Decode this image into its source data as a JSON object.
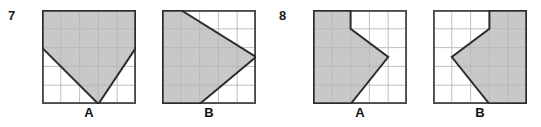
{
  "page": {
    "background_color": "#ffffff",
    "shade_color": "#c8c8c8",
    "grid_line_color": "#b6b6b6",
    "outline_color": "#4a4a4a",
    "shape_line_color": "#2b2b2b"
  },
  "problems": [
    {
      "number": "7",
      "figures": [
        {
          "label": "A",
          "grid": {
            "cols": 5,
            "rows": 5
          },
          "shaded_polygon": [
            [
              0,
              0
            ],
            [
              5,
              0
            ],
            [
              5,
              2
            ],
            [
              3,
              5
            ],
            [
              0,
              2
            ]
          ]
        },
        {
          "label": "B",
          "grid": {
            "cols": 5,
            "rows": 5
          },
          "shaded_polygon": [
            [
              0,
              0
            ],
            [
              1,
              0
            ],
            [
              5,
              2.5
            ],
            [
              2,
              5
            ],
            [
              0,
              5
            ]
          ]
        }
      ]
    },
    {
      "number": "8",
      "figures": [
        {
          "label": "A",
          "grid": {
            "cols": 5,
            "rows": 5
          },
          "shaded_polygon": [
            [
              0,
              0
            ],
            [
              2,
              0
            ],
            [
              2,
              1
            ],
            [
              4,
              2.5
            ],
            [
              2,
              5
            ],
            [
              0,
              5
            ]
          ]
        },
        {
          "label": "B",
          "grid": {
            "cols": 5,
            "rows": 5
          },
          "shaded_polygon": [
            [
              5,
              0
            ],
            [
              3,
              0
            ],
            [
              3,
              1
            ],
            [
              1,
              2.5
            ],
            [
              3,
              5
            ],
            [
              5,
              5
            ]
          ]
        }
      ]
    }
  ]
}
